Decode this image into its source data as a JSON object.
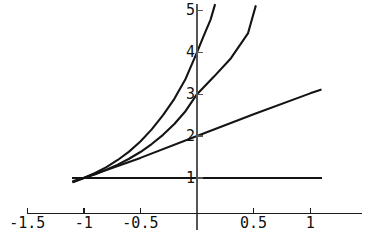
{
  "chart_data": {
    "type": "line",
    "title": "",
    "subtitle": "",
    "xlabel": "",
    "ylabel": "",
    "xlim": [
      -1.55,
      1.2
    ],
    "ylim": [
      0.55,
      5.3
    ],
    "grid": false,
    "legend": "none",
    "background_color": "#ffffff",
    "line_color": "#141414",
    "axis_color": "#1a1a1a",
    "x_ticks": [
      {
        "value": -1.5,
        "label": "-1.5"
      },
      {
        "value": -1,
        "label": "-1"
      },
      {
        "value": -0.5,
        "label": "-0.5"
      },
      {
        "value": 0.5,
        "label": "0.5"
      },
      {
        "value": 1,
        "label": "1"
      }
    ],
    "y_ticks": [
      {
        "value": 1,
        "label": "1"
      },
      {
        "value": 2,
        "label": "2"
      },
      {
        "value": 3,
        "label": "3"
      },
      {
        "value": 4,
        "label": "4"
      },
      {
        "value": 5,
        "label": "5"
      }
    ],
    "series": [
      {
        "name": "steepest-curve",
        "description": "exponential through (-1,1) and (0,4)",
        "x": [
          -1.1,
          -1.0,
          -0.9,
          -0.8,
          -0.7,
          -0.6,
          -0.5,
          -0.4,
          -0.3,
          -0.2,
          -0.1,
          0.0,
          0.06,
          0.12,
          0.16
        ],
        "values": [
          0.9,
          1.0,
          1.12,
          1.26,
          1.43,
          1.63,
          1.87,
          2.16,
          2.5,
          2.89,
          3.37,
          4.0,
          4.4,
          4.78,
          5.15
        ]
      },
      {
        "name": "middle-curve",
        "description": "exponential through (-1,1) and (0,3)",
        "x": [
          -1.1,
          -1.0,
          -0.9,
          -0.8,
          -0.7,
          -0.6,
          -0.5,
          -0.4,
          -0.3,
          -0.2,
          -0.1,
          0.0,
          0.15,
          0.3,
          0.45,
          0.52
        ],
        "values": [
          0.92,
          1.0,
          1.09,
          1.2,
          1.32,
          1.46,
          1.62,
          1.81,
          2.03,
          2.29,
          2.6,
          3.0,
          3.42,
          3.86,
          4.45,
          5.12
        ]
      },
      {
        "name": "flattest-line",
        "description": "near-linear through (-1,1) and (0,2)",
        "x": [
          -1.1,
          -1.0,
          -0.5,
          0.0,
          0.5,
          1.0,
          1.1
        ],
        "values": [
          0.9,
          1.0,
          1.48,
          2.0,
          2.52,
          3.02,
          3.11
        ]
      },
      {
        "name": "horizontal-asymptote",
        "description": "horizontal line at y = 1",
        "x": [
          -1.1,
          1.1
        ],
        "values": [
          1.0,
          1.0
        ]
      }
    ]
  }
}
